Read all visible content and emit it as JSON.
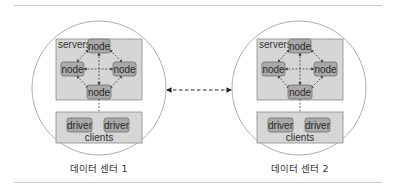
{
  "diagram": {
    "type": "multi-datacenter-architecture",
    "colors": {
      "circle_stroke": "#9a9a9a",
      "box_fill": "#d6d6d6",
      "box_stroke": "#8a8a8a",
      "node_fill": "#a9a9a9",
      "node_stroke": "#6e6e6e",
      "edge": "#444444",
      "rule": "#c8c8c8"
    },
    "datacenters": [
      {
        "label": "데이터 센터 1",
        "servers_label": "servers",
        "nodes": [
          "node",
          "node",
          "node",
          "node"
        ],
        "clients_label": "clients",
        "drivers": [
          "driver",
          "driver"
        ]
      },
      {
        "label": "데이터 센터 2",
        "servers_label": "servers",
        "nodes": [
          "node",
          "node",
          "node",
          "node"
        ],
        "clients_label": "clients",
        "drivers": [
          "driver",
          "driver"
        ]
      }
    ],
    "inter_dc_link": {
      "style": "dashed",
      "direction": "bidirectional"
    }
  }
}
